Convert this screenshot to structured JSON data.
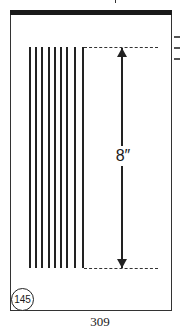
{
  "diagram": {
    "vertical_lines": {
      "count": 9,
      "x_positions": [
        29,
        35,
        41,
        48,
        54,
        60,
        66,
        74,
        82
      ]
    },
    "dimension": {
      "label": "8″"
    },
    "badge": {
      "label": "145"
    },
    "page_number": "309"
  }
}
